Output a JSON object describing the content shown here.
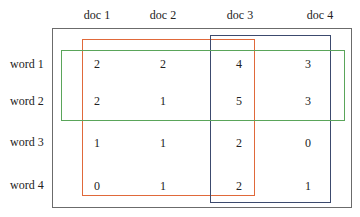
{
  "matrix": {
    "columns": [
      "doc 1",
      "doc 2",
      "doc 3",
      "doc 4"
    ],
    "rows": [
      {
        "label": "word 1",
        "values": [
          "2",
          "2",
          "4",
          "3"
        ]
      },
      {
        "label": "word 2",
        "values": [
          "2",
          "1",
          "5",
          "3"
        ]
      },
      {
        "label": "word 3",
        "values": [
          "1",
          "1",
          "2",
          "0"
        ]
      },
      {
        "label": "word 4",
        "values": [
          "0",
          "1",
          "2",
          "1"
        ]
      }
    ]
  },
  "highlights": {
    "orange": {
      "color": "#e0693a",
      "covers": "doc 1 - doc 3 (partial), all words"
    },
    "navy": {
      "color": "#3c4a6e",
      "covers": "doc 3 - doc 4, all words"
    },
    "green": {
      "color": "#5aa55a",
      "covers": "word 1 - word 2, all docs"
    },
    "outer": {
      "color": "#6b6b6b"
    }
  }
}
